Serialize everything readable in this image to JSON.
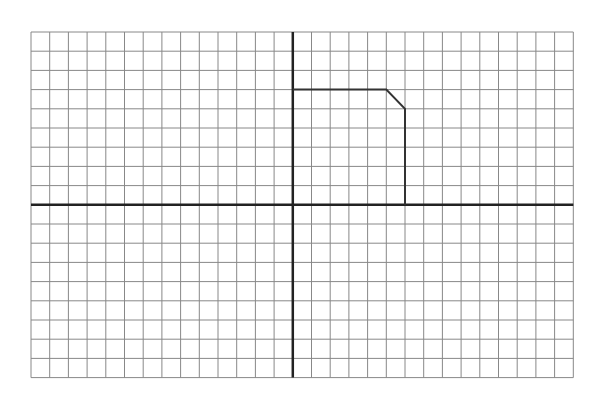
{
  "grid": {
    "left": 31,
    "top": 32,
    "cols": 29,
    "rows": 18,
    "cell_w": 18.7,
    "cell_h": 19.2,
    "origin_col": 14,
    "origin_row": 9,
    "grid_color": "#888888",
    "axis_color": "#222222",
    "shape_color": "#333333"
  },
  "shape": {
    "name": "polygon-outline",
    "points": [
      [
        0,
        6
      ],
      [
        5,
        6
      ],
      [
        6,
        5
      ],
      [
        6,
        0
      ]
    ]
  }
}
